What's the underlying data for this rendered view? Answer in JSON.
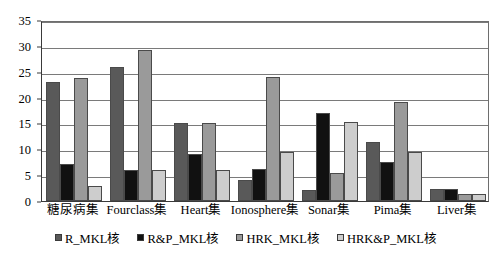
{
  "chart_data": {
    "type": "bar",
    "title": "",
    "xlabel": "",
    "ylabel": "",
    "ylim": [
      0,
      35
    ],
    "ytick_step": 5,
    "yticks": [
      0,
      5,
      10,
      15,
      20,
      25,
      30,
      35
    ],
    "grid": true,
    "legend_position": "bottom",
    "categories": [
      "糖尿病集",
      "Fourclass集",
      "Heart集",
      "Ionosphere集",
      "Sonar集",
      "Pima集",
      "Liver集"
    ],
    "series": [
      {
        "name": "R_MKL核",
        "color": "#595959",
        "values": [
          23,
          26,
          15,
          4.1,
          2.2,
          11.5,
          2.3
        ]
      },
      {
        "name": "R&P_MKL核",
        "color": "#111111",
        "values": [
          7.2,
          6,
          9.1,
          6.2,
          17,
          7.5,
          2.3
        ]
      },
      {
        "name": "HRK_MKL核",
        "color": "#9a9a9a",
        "values": [
          23.8,
          29.2,
          15,
          24,
          5.4,
          19.2,
          1.3
        ]
      },
      {
        "name": "HRK&P_MKL核",
        "color": "#cdcdcd",
        "values": [
          3,
          6,
          6,
          9.4,
          15.2,
          9.4,
          1.3
        ]
      }
    ]
  },
  "legend": {
    "items": [
      {
        "label": "R_MKL核",
        "color": "#595959"
      },
      {
        "label": "R&P_MKL核",
        "color": "#111111"
      },
      {
        "label": "HRK_MKL核",
        "color": "#9a9a9a"
      },
      {
        "label": "HRK&P_MKL核",
        "color": "#cdcdcd"
      }
    ]
  },
  "axes": {
    "y_tick_labels": [
      "35",
      "30",
      "25",
      "20",
      "15",
      "10",
      "5",
      "0"
    ],
    "x_tick_labels": [
      "糖尿病集",
      "Fourclass集",
      "Heart集",
      "Ionosphere集",
      "Sonar集",
      "Pima集",
      "Liver集"
    ]
  }
}
